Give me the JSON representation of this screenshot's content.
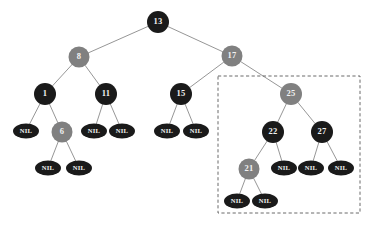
{
  "figure": {
    "type": "red-black-tree-diagram",
    "width": 371,
    "height": 227,
    "background": "#ffffff"
  },
  "colors": {
    "black_node": "#1a1a1a",
    "red_node_rendered_gray": "#808080",
    "nil_node": "#1a1a1a",
    "edge": "#8a8a8a",
    "label_text": "#f2f2f2",
    "highlight_box": "#5a5a5a"
  },
  "nodes": [
    {
      "id": "n13",
      "label": "13",
      "color": "black",
      "shape": "circle",
      "cx": 158,
      "cy": 22,
      "rx": 11,
      "ry": 11
    },
    {
      "id": "n8",
      "label": "8",
      "color": "gray",
      "shape": "circle",
      "cx": 79,
      "cy": 57,
      "rx": 10.5,
      "ry": 10.5
    },
    {
      "id": "n17",
      "label": "17",
      "color": "gray",
      "shape": "circle",
      "cx": 232,
      "cy": 56,
      "rx": 10.5,
      "ry": 10.5
    },
    {
      "id": "n1",
      "label": "1",
      "color": "black",
      "shape": "circle",
      "cx": 45,
      "cy": 94,
      "rx": 11,
      "ry": 11
    },
    {
      "id": "n11",
      "label": "11",
      "color": "black",
      "shape": "circle",
      "cx": 106,
      "cy": 94,
      "rx": 11,
      "ry": 11
    },
    {
      "id": "n15",
      "label": "15",
      "color": "black",
      "shape": "circle",
      "cx": 181,
      "cy": 94,
      "rx": 11,
      "ry": 11
    },
    {
      "id": "n25",
      "label": "25",
      "color": "gray",
      "shape": "circle",
      "cx": 291,
      "cy": 94,
      "rx": 11,
      "ry": 11
    },
    {
      "id": "n6",
      "label": "6",
      "color": "gray",
      "shape": "circle",
      "cx": 62,
      "cy": 132,
      "rx": 10.5,
      "ry": 10.5
    },
    {
      "id": "n22",
      "label": "22",
      "color": "black",
      "shape": "circle",
      "cx": 273,
      "cy": 132,
      "rx": 11,
      "ry": 11
    },
    {
      "id": "n27",
      "label": "27",
      "color": "black",
      "shape": "circle",
      "cx": 322,
      "cy": 132,
      "rx": 11,
      "ry": 11
    },
    {
      "id": "n21",
      "label": "21",
      "color": "gray",
      "shape": "circle",
      "cx": 249,
      "cy": 169,
      "rx": 10.5,
      "ry": 10.5
    },
    {
      "id": "nil1L",
      "label": "NIL",
      "color": "black",
      "shape": "ellipse",
      "cx": 26,
      "cy": 131,
      "rx": 13,
      "ry": 7.5
    },
    {
      "id": "nil6L",
      "label": "NIL",
      "color": "black",
      "shape": "ellipse",
      "cx": 48,
      "cy": 168,
      "rx": 13,
      "ry": 7.5
    },
    {
      "id": "nil6R",
      "label": "NIL",
      "color": "black",
      "shape": "ellipse",
      "cx": 79,
      "cy": 168,
      "rx": 13,
      "ry": 7.5
    },
    {
      "id": "nil11L",
      "label": "NIL",
      "color": "black",
      "shape": "ellipse",
      "cx": 94,
      "cy": 131,
      "rx": 13,
      "ry": 7.5
    },
    {
      "id": "nil11R",
      "label": "NIL",
      "color": "black",
      "shape": "ellipse",
      "cx": 122,
      "cy": 131,
      "rx": 13,
      "ry": 7.5
    },
    {
      "id": "nil15L",
      "label": "NIL",
      "color": "black",
      "shape": "ellipse",
      "cx": 167,
      "cy": 131,
      "rx": 13,
      "ry": 7.5
    },
    {
      "id": "nil15R",
      "label": "NIL",
      "color": "black",
      "shape": "ellipse",
      "cx": 196,
      "cy": 131,
      "rx": 13,
      "ry": 7.5
    },
    {
      "id": "nil22R",
      "label": "NIL",
      "color": "black",
      "shape": "ellipse",
      "cx": 284,
      "cy": 168,
      "rx": 13,
      "ry": 7.5
    },
    {
      "id": "nil27L",
      "label": "NIL",
      "color": "black",
      "shape": "ellipse",
      "cx": 311,
      "cy": 168,
      "rx": 13,
      "ry": 7.5
    },
    {
      "id": "nil27R",
      "label": "NIL",
      "color": "black",
      "shape": "ellipse",
      "cx": 341,
      "cy": 168,
      "rx": 13,
      "ry": 7.5
    },
    {
      "id": "nil21L",
      "label": "NIL",
      "color": "black",
      "shape": "ellipse",
      "cx": 237,
      "cy": 201,
      "rx": 13,
      "ry": 7.5
    },
    {
      "id": "nil21R",
      "label": "NIL",
      "color": "black",
      "shape": "ellipse",
      "cx": 265,
      "cy": 201,
      "rx": 13,
      "ry": 7.5
    }
  ],
  "edges": [
    {
      "from": "n13",
      "to": "n8"
    },
    {
      "from": "n13",
      "to": "n17"
    },
    {
      "from": "n8",
      "to": "n1"
    },
    {
      "from": "n8",
      "to": "n11"
    },
    {
      "from": "n17",
      "to": "n15"
    },
    {
      "from": "n17",
      "to": "n25"
    },
    {
      "from": "n1",
      "to": "nil1L"
    },
    {
      "from": "n1",
      "to": "n6"
    },
    {
      "from": "n6",
      "to": "nil6L"
    },
    {
      "from": "n6",
      "to": "nil6R"
    },
    {
      "from": "n11",
      "to": "nil11L"
    },
    {
      "from": "n11",
      "to": "nil11R"
    },
    {
      "from": "n15",
      "to": "nil15L"
    },
    {
      "from": "n15",
      "to": "nil15R"
    },
    {
      "from": "n25",
      "to": "n22"
    },
    {
      "from": "n25",
      "to": "n27"
    },
    {
      "from": "n22",
      "to": "n21"
    },
    {
      "from": "n22",
      "to": "nil22R"
    },
    {
      "from": "n27",
      "to": "nil27L"
    },
    {
      "from": "n27",
      "to": "nil27R"
    },
    {
      "from": "n21",
      "to": "nil21L"
    },
    {
      "from": "n21",
      "to": "nil21R"
    }
  ],
  "highlight_box": {
    "x": 218,
    "y": 76,
    "width": 142,
    "height": 137,
    "style": "dashed"
  }
}
